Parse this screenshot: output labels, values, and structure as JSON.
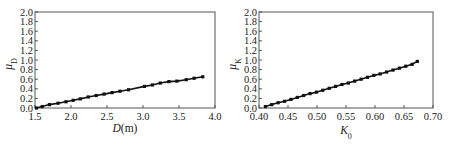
{
  "chart_data": [
    {
      "type": "line",
      "title": "",
      "xlabel": "D(m)",
      "xlabel_main": "D",
      "xlabel_unit": "(m)",
      "ylabel": "μD",
      "ylabel_main": "μ",
      "ylabel_sub": "D",
      "xlim": [
        1.5,
        4.0
      ],
      "ylim": [
        0.0,
        2.0
      ],
      "xticks": [
        "1.5",
        "2.0",
        "2.5",
        "3.0",
        "3.5",
        "4.0"
      ],
      "xtick_values": [
        1.5,
        2.0,
        2.5,
        3.0,
        3.5,
        4.0
      ],
      "yticks": [
        "0.0",
        "0.2",
        "0.4",
        "0.6",
        "0.8",
        "1.0",
        "1.2",
        "1.4",
        "1.6",
        "1.8",
        "2.0"
      ],
      "ytick_values": [
        0.0,
        0.2,
        0.4,
        0.6,
        0.8,
        1.0,
        1.2,
        1.4,
        1.6,
        1.8,
        2.0
      ],
      "grid": false,
      "series": [
        {
          "name": "μD",
          "x": [
            1.52,
            1.6,
            1.7,
            1.82,
            1.93,
            2.03,
            2.13,
            2.24,
            2.35,
            2.46,
            2.57,
            2.68,
            2.8,
            3.02,
            3.13,
            3.24,
            3.36,
            3.47,
            3.6,
            3.71,
            3.83
          ],
          "y": [
            0.0,
            0.03,
            0.07,
            0.1,
            0.13,
            0.16,
            0.19,
            0.23,
            0.26,
            0.29,
            0.32,
            0.35,
            0.38,
            0.45,
            0.48,
            0.52,
            0.55,
            0.56,
            0.59,
            0.62,
            0.65
          ]
        }
      ]
    },
    {
      "type": "line",
      "title": "",
      "xlabel": "K0",
      "xlabel_main": "K",
      "xlabel_sub": "0",
      "ylabel": "μK",
      "ylabel_main": "μ",
      "ylabel_sub": "K",
      "xlim": [
        0.4,
        0.7
      ],
      "ylim": [
        0.0,
        2.0
      ],
      "xticks": [
        "0.40",
        "0.45",
        "0.50",
        "0.55",
        "0.60",
        "0.65",
        "0.70"
      ],
      "xtick_values": [
        0.4,
        0.45,
        0.5,
        0.55,
        0.6,
        0.65,
        0.7
      ],
      "yticks": [
        "0.0",
        "0.2",
        "0.4",
        "0.6",
        "0.8",
        "1.0",
        "1.2",
        "1.4",
        "1.6",
        "1.8",
        "2.0"
      ],
      "ytick_values": [
        0.0,
        0.2,
        0.4,
        0.6,
        0.8,
        1.0,
        1.2,
        1.4,
        1.6,
        1.8,
        2.0
      ],
      "grid": false,
      "series": [
        {
          "name": "μK",
          "x": [
            0.411,
            0.422,
            0.433,
            0.444,
            0.455,
            0.466,
            0.477,
            0.488,
            0.499,
            0.51,
            0.521,
            0.532,
            0.543,
            0.554,
            0.565,
            0.576,
            0.587,
            0.598,
            0.609,
            0.62,
            0.631,
            0.642,
            0.653,
            0.664,
            0.673
          ],
          "y": [
            0.03,
            0.07,
            0.11,
            0.14,
            0.18,
            0.22,
            0.26,
            0.3,
            0.33,
            0.37,
            0.41,
            0.45,
            0.49,
            0.52,
            0.56,
            0.6,
            0.64,
            0.68,
            0.71,
            0.75,
            0.79,
            0.83,
            0.87,
            0.91,
            0.97
          ]
        }
      ]
    }
  ]
}
